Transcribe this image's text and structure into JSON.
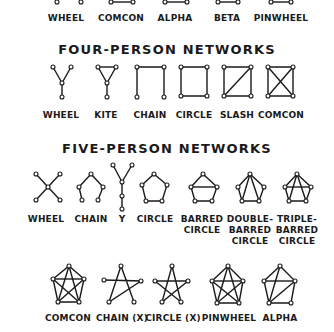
{
  "sections": [
    {
      "title": "",
      "networks": [
        {
          "label": "WHEEL"
        },
        {
          "label": "COMCON"
        },
        {
          "label": "ALPHA"
        },
        {
          "label": "BETA"
        },
        {
          "label": "PINWHEEL"
        }
      ]
    },
    {
      "title": "FOUR-PERSON NETWORKS",
      "networks": [
        {
          "label": "WHEEL"
        },
        {
          "label": "KITE"
        },
        {
          "label": "CHAIN"
        },
        {
          "label": "CIRCLE"
        },
        {
          "label": "SLASH"
        },
        {
          "label": "COMCON"
        }
      ]
    },
    {
      "title": "FIVE-PERSON NETWORKS",
      "networks": [
        {
          "label": "WHEEL"
        },
        {
          "label": "CHAIN"
        },
        {
          "label": "Y"
        },
        {
          "label": "CIRCLE"
        },
        {
          "label": "BARRED\nCIRCLE"
        },
        {
          "label": "DOUBLE-\nBARRED\nCIRCLE"
        },
        {
          "label": "TRIPLE-\nBARRED\nCIRCLE"
        },
        {
          "label": "COMCON"
        },
        {
          "label": "CHAIN (X)"
        },
        {
          "label": "CIRCLE (X)"
        },
        {
          "label": "PINWHEEL"
        },
        {
          "label": "ALPHA"
        }
      ]
    }
  ]
}
